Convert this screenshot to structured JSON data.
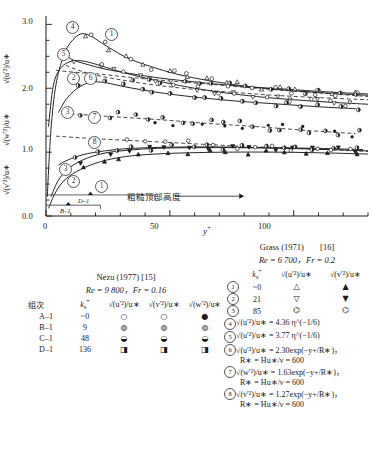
{
  "chart_data": {
    "type": "line",
    "title": "",
    "xlabel": "y+",
    "ylabel": "sqrt(u'^2)/u* , sqrt(w'^2)/u* , sqrt(v'^2)/u*",
    "xlim": [
      0,
      130
    ],
    "ylim": [
      0.0,
      3.1
    ],
    "xticks": [
      0,
      50,
      100
    ],
    "xtick_labels": [
      "0",
      "50",
      "100"
    ],
    "yticks": [
      0.0,
      1.0,
      2.0,
      3.0
    ],
    "ytick_labels": [
      "0.0",
      "1.0",
      "2.0",
      "3.0"
    ],
    "grid": false,
    "legend_position": "below-plot",
    "annotations": [
      "粗糙顶部高度",
      "B-1",
      "D-1"
    ],
    "series": [
      {
        "name": "1",
        "label": "sqrt(u'^2)/u*  ks+ ~0",
        "style": "solid",
        "x": [
          0.5,
          2,
          4,
          7,
          10,
          14,
          18,
          22,
          27,
          33,
          40,
          50,
          60,
          72,
          85,
          100,
          115,
          130
        ],
        "y": [
          0.3,
          1.35,
          2.05,
          2.5,
          2.72,
          2.85,
          2.82,
          2.72,
          2.6,
          2.47,
          2.37,
          2.25,
          2.16,
          2.08,
          2.01,
          1.96,
          1.92,
          1.89
        ]
      },
      {
        "name": "2",
        "label": "sqrt(u'^2)/u*  ks+ 21",
        "style": "solid",
        "x": [
          1,
          3,
          6,
          10,
          14,
          18,
          24,
          30,
          38,
          48,
          60,
          72,
          85,
          100,
          115,
          130
        ],
        "y": [
          1.4,
          2.05,
          2.32,
          2.42,
          2.43,
          2.4,
          2.33,
          2.26,
          2.18,
          2.09,
          2.0,
          1.93,
          1.87,
          1.82,
          1.78,
          1.75
        ]
      },
      {
        "name": "3",
        "label": "sqrt(u'^2)/u*  ks+ 85",
        "style": "solid",
        "x": [
          5,
          8,
          12,
          16,
          20,
          25,
          31,
          38,
          46,
          56,
          68,
          80,
          95,
          110,
          125
        ],
        "y": [
          1.62,
          1.82,
          1.98,
          2.07,
          2.1,
          2.08,
          2.03,
          1.98,
          1.93,
          1.88,
          1.83,
          1.79,
          1.75,
          1.71,
          1.68
        ]
      },
      {
        "name": "4",
        "label": "sqrt(u'^2)/u* = 4.36 eta^(-1/6)",
        "style": "solid-asymptote",
        "x": [
          6,
          10,
          16,
          24,
          34,
          46,
          60,
          76,
          95,
          115,
          130
        ],
        "y": [
          2.6,
          2.46,
          2.38,
          2.3,
          2.23,
          2.16,
          2.1,
          2.04,
          1.99,
          1.94,
          1.91
        ]
      },
      {
        "name": "5",
        "label": "sqrt(u'^2)/u* = 3.77 eta^(-1/6)",
        "style": "dashed",
        "x": [
          8,
          14,
          22,
          32,
          44,
          58,
          74,
          92,
          112,
          130
        ],
        "y": [
          2.36,
          2.27,
          2.19,
          2.12,
          2.05,
          1.99,
          1.94,
          1.89,
          1.85,
          1.82
        ]
      },
      {
        "name": "6",
        "label": "sqrt(u'^2)/u* = 2.30 exp(-y+/R*), R* = H u*/v = 600",
        "style": "dashed",
        "x": [
          4,
          12,
          22,
          34,
          48,
          64,
          82,
          102,
          120,
          130
        ],
        "y": [
          2.28,
          2.25,
          2.22,
          2.17,
          2.12,
          2.07,
          2.01,
          1.95,
          1.9,
          1.87
        ]
      },
      {
        "name": "7",
        "label": "sqrt(w'^2)/u* = 1.63 exp(-y+/R*), R* = H u*/v = 600",
        "style": "dashed",
        "x": [
          10,
          25,
          45,
          65,
          85,
          105,
          125
        ],
        "y": [
          1.6,
          1.56,
          1.51,
          1.45,
          1.4,
          1.34,
          1.29
        ]
      },
      {
        "name": "8",
        "label": "sqrt(v'^2)/u* = 1.27 exp(-y+/R*), R* = H u*/v = 600",
        "style": "dashed",
        "x": [
          4,
          20,
          40,
          60,
          80,
          100,
          120,
          130
        ],
        "y": [
          1.25,
          1.21,
          1.17,
          1.13,
          1.09,
          1.06,
          1.03,
          1.01
        ]
      },
      {
        "name": "v-1",
        "label": "sqrt(v'^2)/u*  ks+ ~0",
        "style": "solid-lower",
        "x": [
          1,
          4,
          8,
          14,
          22,
          32,
          44,
          58,
          74,
          92,
          110,
          130
        ],
        "y": [
          0.12,
          0.38,
          0.58,
          0.73,
          0.85,
          0.93,
          0.97,
          0.99,
          1.0,
          1.0,
          0.99,
          0.97
        ]
      },
      {
        "name": "v-2",
        "label": "sqrt(v'^2)/u*  ks+ 21",
        "style": "solid-lower",
        "x": [
          2,
          5,
          9,
          15,
          23,
          33,
          45,
          60,
          78,
          96,
          115,
          130
        ],
        "y": [
          0.3,
          0.56,
          0.74,
          0.88,
          0.98,
          1.03,
          1.06,
          1.07,
          1.07,
          1.06,
          1.04,
          1.02
        ]
      },
      {
        "name": "v-3",
        "label": "sqrt(v'^2)/u*  ks+ 85",
        "style": "solid-lower",
        "x": [
          5,
          9,
          15,
          22,
          31,
          42,
          55,
          70,
          88,
          108,
          128
        ],
        "y": [
          0.8,
          0.88,
          0.96,
          1.01,
          1.05,
          1.07,
          1.08,
          1.08,
          1.07,
          1.06,
          1.04
        ]
      }
    ]
  },
  "axes": {
    "y_labels": {
      "u": "√(u′²)/u∗",
      "w": "√(w′²)/u∗",
      "v": "√(v′²)/u∗"
    },
    "ytick_0": "0.0",
    "ytick_1": "1.0",
    "ytick_2": "2.0",
    "ytick_3": "3.0",
    "xtick_0": "0",
    "xtick_50": "50",
    "xtick_100": "100",
    "x_title": "y",
    "x_title_sup": "+"
  },
  "plot_annotations": {
    "roughness_note": "粗糙顶部高度",
    "marker_b1": "B–1",
    "marker_d1": "D–1",
    "curve_tags": {
      "c1_top": "1",
      "c2_top": "2",
      "c3_top": "3",
      "c4": "4",
      "c5": "5",
      "c6": "6",
      "c7": "7",
      "c8": "8",
      "c1_bot": "1",
      "c2_bot": "2",
      "c3_bot": "3"
    }
  },
  "legend_left": {
    "title": "Nezu (1977) [15]",
    "subtitle": "Re = 9 800，Fr = 0.16",
    "headers": {
      "group": "组次",
      "ks": "k",
      "ks_sub": "s",
      "ks_sup": "+",
      "col_u": "√(u′²)/u∗",
      "col_v": "√(v′²)/u∗",
      "col_w": "√(w′²)/u∗"
    },
    "rows": [
      {
        "group": "A–1",
        "ks": "~0",
        "sym_u": "○",
        "sym_v": "○",
        "sym_w": "●"
      },
      {
        "group": "B–1",
        "ks": "9",
        "sym_u": "◍",
        "sym_v": "◍",
        "sym_w": "◍"
      },
      {
        "group": "C–1",
        "ks": "48",
        "sym_u": "◒",
        "sym_v": "◒",
        "sym_w": "◒"
      },
      {
        "group": "D–1",
        "ks": "136",
        "sym_u": "◨",
        "sym_v": "◨",
        "sym_w": "◨"
      }
    ]
  },
  "legend_right": {
    "title": "Grass (1971)",
    "ref": "[16]",
    "subtitle": "Re = 6 700，Fr = 0.2",
    "headers": {
      "ks": "k",
      "ks_sub": "s",
      "ks_sup": "+",
      "col_u": "√(u′²)/u∗",
      "col_v": "√(v′²)/u∗"
    },
    "rows": [
      {
        "num": "1",
        "ks": "~0",
        "sym_u": "△",
        "sym_v": "▲"
      },
      {
        "num": "2",
        "ks": "21",
        "sym_u": "▽",
        "sym_v": "▼"
      },
      {
        "num": "3",
        "ks": "85",
        "sym_u": "⌬",
        "sym_v": "⌬"
      }
    ],
    "equations": [
      {
        "num": "4",
        "line1": "√(u′²)/u∗ = 4.36 η^(−1/6)",
        "line2": ""
      },
      {
        "num": "5",
        "line1": "√(u′²)/u∗ = 3.77 η^(−1/6)",
        "line2": ""
      },
      {
        "num": "6",
        "line1": "√(u′²)/u∗ = 2.30exp(−y+/R∗)，",
        "line2": "R∗ = Hu∗/ν = 600"
      },
      {
        "num": "7",
        "line1": "√(w′²)/u∗ = 1.63exp(−y+/R∗)，",
        "line2": "R∗ = Hu∗/ν = 600"
      },
      {
        "num": "8",
        "line1": "√(v′²)/u∗ = 1.27exp(−y+/R∗)，",
        "line2": "R∗ = Hu∗/ν = 600"
      }
    ]
  }
}
